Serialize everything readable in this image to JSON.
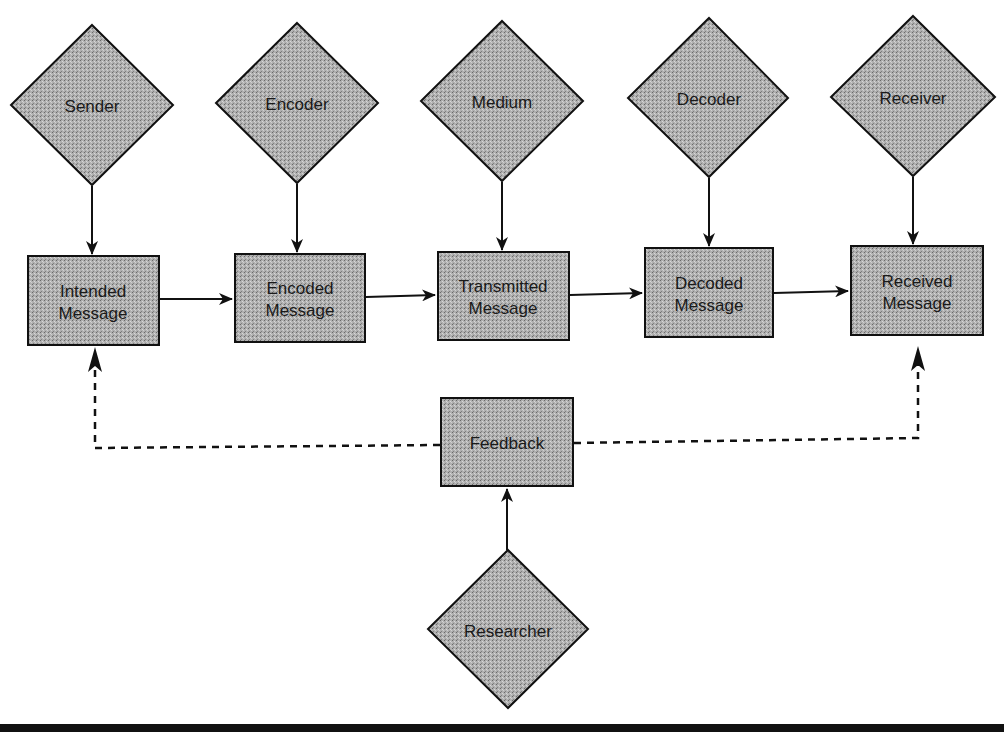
{
  "diagram": {
    "type": "communication-process-flow",
    "actors": [
      {
        "id": "sender",
        "label": "Sender"
      },
      {
        "id": "encoder",
        "label": "Encoder"
      },
      {
        "id": "medium",
        "label": "Medium"
      },
      {
        "id": "decoder",
        "label": "Decoder"
      },
      {
        "id": "receiver",
        "label": "Receiver"
      }
    ],
    "messages": [
      {
        "id": "intended",
        "line1": "Intended",
        "line2": "Message"
      },
      {
        "id": "encoded",
        "line1": "Encoded",
        "line2": "Message"
      },
      {
        "id": "transmitted",
        "line1": "Transmitted",
        "line2": "Message"
      },
      {
        "id": "decoded",
        "line1": "Decoded",
        "line2": "Message"
      },
      {
        "id": "received",
        "line1": "Received",
        "line2": "Message"
      }
    ],
    "feedback": {
      "label": "Feedback"
    },
    "researcher": {
      "label": "Researcher"
    },
    "colors": {
      "fill": "#a8a8a8",
      "stroke": "#111111",
      "background": "#ffffff"
    }
  }
}
